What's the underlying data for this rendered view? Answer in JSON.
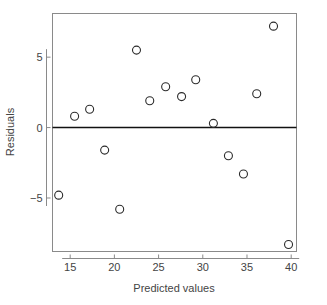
{
  "chart_data": {
    "type": "scatter",
    "title": "",
    "xlabel": "Predicted values",
    "ylabel": "Residuals",
    "xlim": [
      13.0,
      40.6
    ],
    "ylim": [
      -8.8,
      8.1
    ],
    "xticks": [
      15,
      20,
      25,
      30,
      35,
      40
    ],
    "xticklabels": [
      "15",
      "20",
      "25",
      "30",
      "35",
      "40"
    ],
    "yticks": [
      5,
      0,
      -5
    ],
    "yticklabels": [
      "5",
      "0",
      "−5"
    ],
    "grid": false,
    "legend": null,
    "reference_lines": [
      {
        "name": "zero-residual-line",
        "orientation": "horizontal",
        "y": 0
      }
    ],
    "marker": {
      "shape": "open-circle",
      "radius_px": 4,
      "edge_color": "#2b2b2b",
      "fill_color": "none"
    },
    "points": [
      {
        "x": 13.7,
        "y": -4.8
      },
      {
        "x": 15.5,
        "y": 0.8
      },
      {
        "x": 17.2,
        "y": 1.3
      },
      {
        "x": 18.9,
        "y": -1.6
      },
      {
        "x": 20.6,
        "y": -5.8
      },
      {
        "x": 22.5,
        "y": 5.5
      },
      {
        "x": 24.0,
        "y": 1.9
      },
      {
        "x": 25.8,
        "y": 2.9
      },
      {
        "x": 27.6,
        "y": 2.2
      },
      {
        "x": 29.2,
        "y": 3.4
      },
      {
        "x": 31.2,
        "y": 0.3
      },
      {
        "x": 32.9,
        "y": -2.0
      },
      {
        "x": 34.6,
        "y": -3.3
      },
      {
        "x": 36.1,
        "y": 2.4
      },
      {
        "x": 38.0,
        "y": 7.2
      },
      {
        "x": 39.7,
        "y": -8.3
      }
    ]
  },
  "colors": {
    "background": "#ffffff",
    "frame": "#8a8a8a",
    "zero_line": "#111111",
    "marker_edge": "#2b2b2b",
    "text": "#444444"
  }
}
